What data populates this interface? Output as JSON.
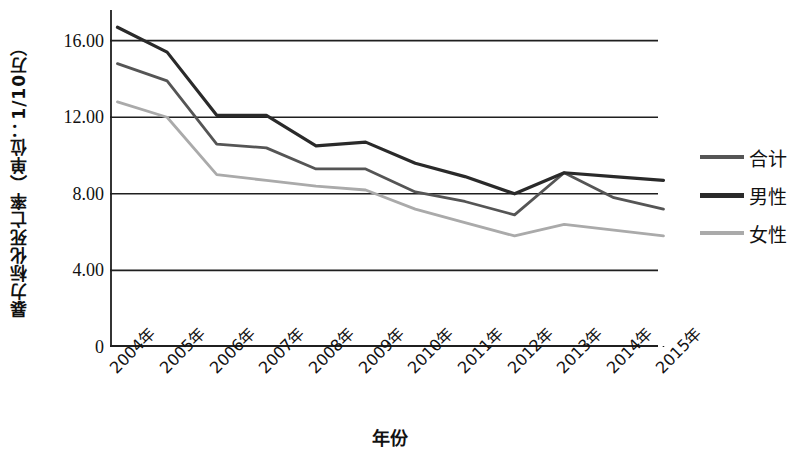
{
  "chart_data": {
    "type": "line",
    "title": "",
    "xlabel": "年份",
    "ylabel": "暴力标化死亡率（单位：1/10万）",
    "categories": [
      "2004年",
      "2005年",
      "2006年",
      "2007年",
      "2008年",
      "2009年",
      "2010年",
      "2011年",
      "2012年",
      "2013年",
      "2014年",
      "2015年"
    ],
    "series": [
      {
        "name": "合计",
        "color": "#555555",
        "values": [
          14.8,
          13.9,
          10.6,
          10.4,
          9.3,
          9.3,
          8.1,
          7.6,
          6.9,
          9.1,
          7.8,
          7.2
        ]
      },
      {
        "name": "男性",
        "color": "#2a2a2a",
        "values": [
          16.7,
          15.4,
          12.1,
          12.1,
          10.5,
          10.7,
          9.6,
          8.9,
          8.0,
          9.1,
          8.9,
          8.7
        ]
      },
      {
        "name": "女性",
        "color": "#aaaaaa",
        "values": [
          12.8,
          12.0,
          9.0,
          8.7,
          8.4,
          8.2,
          7.2,
          6.5,
          5.8,
          6.4,
          6.1,
          5.8
        ]
      }
    ],
    "ylim": [
      0,
      17.6
    ],
    "yticks": [
      0,
      4,
      8,
      12,
      16
    ],
    "ytick_labels": [
      "0",
      "4.00",
      "8.00",
      "12.00",
      "16.00"
    ],
    "grid": true,
    "grid_axis": "y",
    "legend_position": "right"
  },
  "legend": {
    "entries": [
      {
        "label": "合计",
        "color": "#555555",
        "width": 4
      },
      {
        "label": "男性",
        "color": "#2a2a2a",
        "width": 5
      },
      {
        "label": "女性",
        "color": "#aaaaaa",
        "width": 4
      }
    ]
  },
  "axes": {
    "y_title": "暴力标化死亡率（单位：1/10万）",
    "x_title": "年份"
  }
}
